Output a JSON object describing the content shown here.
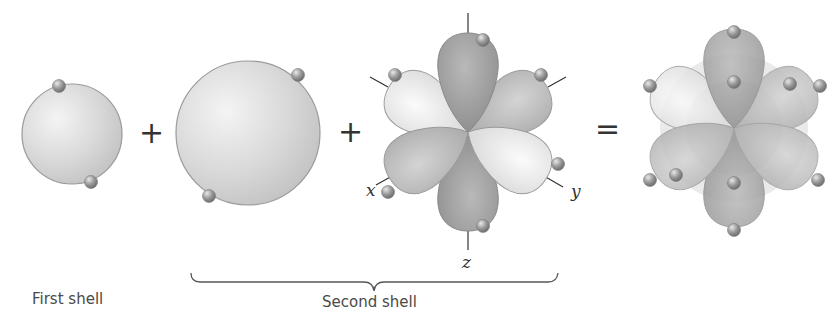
{
  "figure": {
    "operators": {
      "plus_1": "+",
      "plus_2": "+",
      "equals": "="
    },
    "labels": {
      "first_shell": "First shell",
      "second_shell": "Second shell"
    },
    "axes": {
      "x": "x",
      "y": "y",
      "z": "z"
    },
    "components": [
      {
        "name": "1s orbital",
        "shape": "sphere",
        "electrons": 2
      },
      {
        "name": "2s orbital",
        "shape": "sphere",
        "electrons": 2
      },
      {
        "name": "2p orbitals",
        "shape": "three dumbbells (x, y, z)",
        "electrons": 6
      },
      {
        "name": "combined orbitals",
        "shape": "superimposed",
        "electrons": 10
      }
    ],
    "colors": {
      "sphere_fill": "#d6d6d6",
      "sphere_stroke": "#9a9a9a",
      "lobe_dark": "#9b9b9b",
      "lobe_mid": "#b8b8b8",
      "lobe_light": "#e2e2e2",
      "electron": "#8f8f8f"
    }
  }
}
